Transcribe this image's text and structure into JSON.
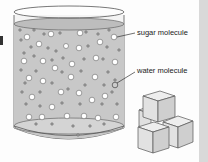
{
  "diagram": {
    "labels": {
      "sugar": "sugar molecule",
      "water": "water molecule"
    },
    "colors": {
      "liquid": "#c8c8c8",
      "glass_outline": "#555555",
      "sugar_molecule": "#ffffff",
      "water_molecule": "#9a9a9a",
      "cube_face_front": "#e0e0e0",
      "cube_face_side": "#cfcfcf",
      "cube_face_top": "#eeeeee",
      "edge_strip": "#d9d9d9"
    },
    "elements": [
      "beaker-with-solution",
      "sugar-molecules",
      "water-molecules",
      "sugar-cubes"
    ]
  }
}
